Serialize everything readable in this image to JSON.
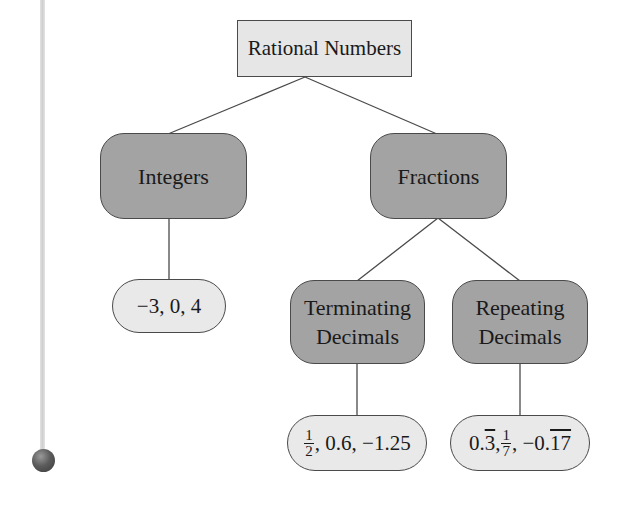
{
  "diagram": {
    "root": {
      "label": "Rational Numbers"
    },
    "categories": [
      {
        "label": "Integers",
        "example": "−3, 0, 4"
      },
      {
        "label": "Fractions",
        "children": [
          {
            "label_line1": "Terminating",
            "label_line2": "Decimals",
            "example": {
              "frac_num": "1",
              "frac_den": "2",
              "rest": ", 0.6, −1.25"
            }
          },
          {
            "label_line1": "Repeating",
            "label_line2": "Decimals",
            "example": {
              "part1": "0.",
              "part1_overline": "3",
              "sep1": ", ",
              "frac_num": "1",
              "frac_den": "7",
              "sep2": " , −0.",
              "part2_overline": "17"
            }
          }
        ]
      }
    ]
  },
  "colors": {
    "root_fill": "#e6e6e6",
    "category_fill": "#a3a3a3",
    "example_fill": "#e9e9e9",
    "stroke": "#4a4a4a"
  }
}
